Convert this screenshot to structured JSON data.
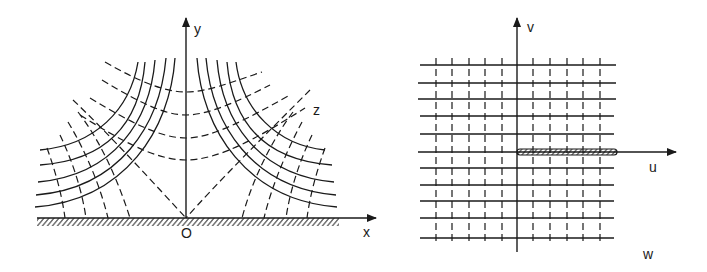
{
  "figure": {
    "z_plane": {
      "axis_x_label": "x",
      "axis_y_label": "y",
      "origin_label": "O",
      "plane_label": "z",
      "boundary": "hatched x-axis (conductor)",
      "solid_curves": "hyperbolas xy = const (both quadrants)",
      "dashed_curves": "hyperbolas x^2 - y^2 = const plus asymptotes at 45 degrees"
    },
    "w_plane": {
      "axis_u_label": "u",
      "axis_v_label": "v",
      "plane_label": "w",
      "slit": "hatched segment along positive u-axis from origin",
      "solid_lines": "horizontal lines v = const",
      "dashed_lines": "vertical lines u = const"
    }
  },
  "colors": {
    "ink": "#1a1a1a",
    "background": "#ffffff"
  }
}
